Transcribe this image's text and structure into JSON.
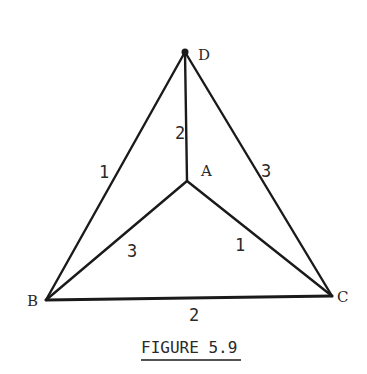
{
  "caption": "FIGURE 5.9",
  "vertices": {
    "D": {
      "label": "D",
      "x": 185,
      "y": 52
    },
    "A": {
      "label": "A",
      "x": 187,
      "y": 181
    },
    "B": {
      "label": "B",
      "x": 46,
      "y": 300
    },
    "C": {
      "label": "C",
      "x": 332,
      "y": 296
    }
  },
  "edges": [
    {
      "from": "D",
      "to": "B",
      "weight": "1"
    },
    {
      "from": "D",
      "to": "A",
      "weight": "2"
    },
    {
      "from": "D",
      "to": "C",
      "weight": "3"
    },
    {
      "from": "A",
      "to": "B",
      "weight": "3"
    },
    {
      "from": "A",
      "to": "C",
      "weight": "1"
    },
    {
      "from": "B",
      "to": "C",
      "weight": "2"
    }
  ],
  "labels": {
    "vertex_D": "D",
    "vertex_A": "A",
    "vertex_B": "B",
    "vertex_C": "C",
    "edge_DB": "1",
    "edge_DA": "2",
    "edge_DC": "3",
    "edge_AB": "3",
    "edge_AC": "1",
    "edge_BC": "2"
  }
}
